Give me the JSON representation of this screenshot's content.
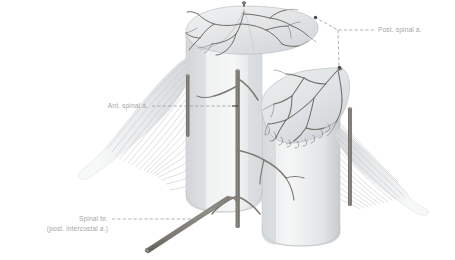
{
  "figure": {
    "background_color": "#ffffff",
    "width": 455,
    "height": 260
  },
  "palette": {
    "vessel": "#7d7a72",
    "vessel_dark": "#6f6c66",
    "cord_light": "#f2f3f4",
    "cord_mid": "#dcdee0",
    "cord_shadow": "#c2c5c8",
    "rootlet": "#c3c5c7",
    "label_text": "#a6a6a6",
    "leader_line": "#8f8f8f",
    "leader_dot": "#4a4a4a"
  },
  "labels": [
    {
      "id": "post-spinal-a",
      "lines": [
        "Post. spinal a."
      ],
      "x": 378,
      "y": 30,
      "anchor": "start"
    },
    {
      "id": "ant-spinal-a",
      "lines": [
        "Ant. spinal a."
      ],
      "x": 148,
      "y": 108,
      "anchor": "end"
    },
    {
      "id": "spinal-br",
      "lines": [
        "Spinal br.",
        "(post. intercostal a.)"
      ],
      "x": 108,
      "y": 222,
      "anchor": "end"
    }
  ],
  "structures": [
    {
      "id": "spinal-cord-body",
      "name": "spinal cord segment"
    },
    {
      "id": "upper-cut-surface",
      "name": "upper transverse cut surface"
    },
    {
      "id": "lower-cut-surface",
      "name": "lower transverse cut surface"
    },
    {
      "id": "anterior-spinal-artery",
      "name": "anterior spinal artery"
    },
    {
      "id": "posterior-spinal-artery-left",
      "name": "posterior spinal artery (left)"
    },
    {
      "id": "posterior-spinal-artery-right",
      "name": "posterior spinal artery (right)"
    },
    {
      "id": "spinal-branch-artery",
      "name": "spinal branch of posterior intercostal artery"
    },
    {
      "id": "nerve-rootlets-left",
      "name": "left nerve rootlets"
    },
    {
      "id": "nerve-rootlets-right",
      "name": "right nerve rootlets"
    },
    {
      "id": "nerve-root-left",
      "name": "left spinal nerve root"
    },
    {
      "id": "nerve-root-right",
      "name": "right spinal nerve root"
    }
  ]
}
